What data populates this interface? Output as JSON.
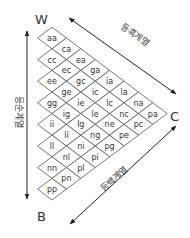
{
  "diagram": {
    "corners": {
      "white": "W",
      "color": "C",
      "black": "B"
    },
    "axes": {
      "top": "등흑계열",
      "left": "등순계열",
      "bottom": "등백계열"
    },
    "letters": [
      "a",
      "c",
      "e",
      "g",
      "i",
      "l",
      "n",
      "p"
    ],
    "cells": [
      [
        "aa"
      ],
      [
        "ca",
        "cc"
      ],
      [
        "ea",
        "ec",
        "ee"
      ],
      [
        "ga",
        "gc",
        "ge",
        "gg"
      ],
      [
        "ia",
        "ic",
        "ie",
        "ig",
        "ii"
      ],
      [
        "la",
        "lc",
        "le",
        "lg",
        "li",
        "ll"
      ],
      [
        "na",
        "nc",
        "ne",
        "ng",
        "ni",
        "nl",
        "nn"
      ],
      [
        "pa",
        "pc",
        "pe",
        "pg",
        "pi",
        "pl",
        "pn",
        "pp"
      ]
    ],
    "colors": {
      "line": "#555555",
      "text": "#333333",
      "arrow": "#222222"
    }
  }
}
